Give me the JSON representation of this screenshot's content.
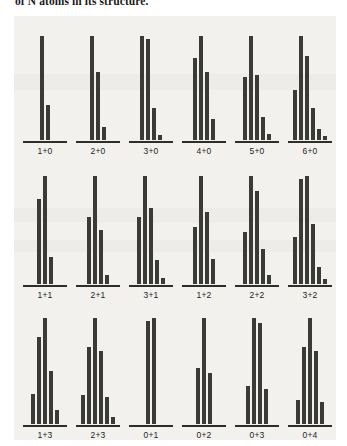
{
  "page": {
    "caption_fragment": "of N atoms in its structure."
  },
  "chart_data": {
    "type": "bar",
    "title": "",
    "subtitle": "",
    "xlabel": "",
    "ylabel": "",
    "ylim": [
      0,
      100
    ],
    "grid": false,
    "legend": null,
    "layout": {
      "rows": 3,
      "cols": 6
    },
    "panels": [
      {
        "label": "1+0",
        "values": [
          100,
          33
        ]
      },
      {
        "label": "2+0",
        "values": [
          100,
          65,
          12
        ]
      },
      {
        "label": "3+0",
        "values": [
          100,
          97,
          30,
          4
        ]
      },
      {
        "label": "4+0",
        "values": [
          78,
          100,
          65,
          20
        ]
      },
      {
        "label": "5+0",
        "values": [
          60,
          100,
          62,
          22,
          5
        ]
      },
      {
        "label": "6+0",
        "values": [
          48,
          100,
          80,
          30,
          10,
          3
        ]
      },
      {
        "label": "1+1",
        "values": [
          78,
          100,
          25
        ]
      },
      {
        "label": "2+1",
        "values": [
          62,
          100,
          50,
          8
        ]
      },
      {
        "label": "3+1",
        "values": [
          62,
          100,
          70,
          22,
          5
        ]
      },
      {
        "label": "1+2",
        "values": [
          52,
          100,
          66,
          23
        ]
      },
      {
        "label": "2+2",
        "values": [
          48,
          100,
          86,
          32,
          8
        ]
      },
      {
        "label": "3+2",
        "values": [
          43,
          97,
          100,
          55,
          15,
          4
        ]
      },
      {
        "label": "1+3",
        "values": [
          28,
          82,
          100,
          50,
          13
        ]
      },
      {
        "label": "2+3",
        "values": [
          27,
          72,
          100,
          68,
          25,
          6
        ]
      },
      {
        "label": "0+1",
        "values": [
          97,
          100
        ]
      },
      {
        "label": "0+2",
        "values": [
          52,
          100,
          48
        ]
      },
      {
        "label": "0+3",
        "values": [
          35,
          100,
          95,
          33
        ]
      },
      {
        "label": "0+4",
        "values": [
          22,
          72,
          100,
          68,
          20
        ]
      }
    ],
    "colors": {
      "bar": "#3a3a38",
      "axis": "#2e2e2c",
      "background": "#f2f1ee",
      "text": "#1e1e1c"
    }
  }
}
